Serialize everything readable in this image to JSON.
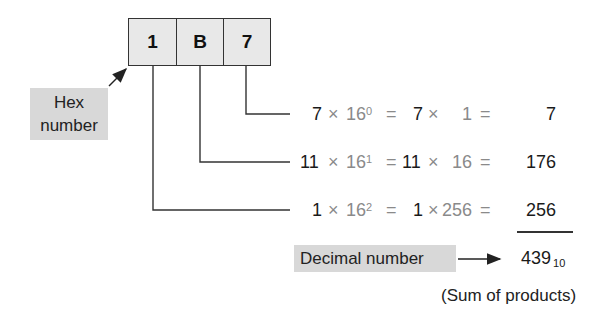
{
  "hex_number": {
    "label_line1": "Hex",
    "label_line2": "number",
    "digits": [
      "1",
      "B",
      "7"
    ]
  },
  "rows": [
    {
      "digit": "7",
      "base": "16",
      "exp": "0",
      "eq1": "=",
      "coef": "7",
      "times": "×",
      "power_value": "1",
      "eq2": "=",
      "result": "7"
    },
    {
      "digit": "11",
      "base": "16",
      "exp": "1",
      "eq1": "=",
      "coef": "11",
      "times": "×",
      "power_value": "16",
      "eq2": "=",
      "result": "176"
    },
    {
      "digit": "1",
      "base": "16",
      "exp": "2",
      "eq1": "=",
      "coef": "1",
      "times": "×",
      "power_value": "256",
      "eq2": "=",
      "result": "256"
    }
  ],
  "decimal": {
    "label": "Decimal number",
    "value": "439",
    "base_subscript": "10",
    "note": "(Sum of products)"
  },
  "colors": {
    "cell_fill": "#e8e8e8",
    "label_fill": "#d8d8d8",
    "line": "#333333",
    "gray_text": "#8a8a8a"
  }
}
